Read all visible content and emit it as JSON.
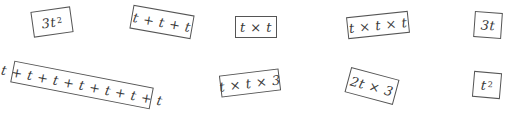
{
  "cards": [
    {
      "base": "3t",
      "sup": "2",
      "cx": 52,
      "cy": 22,
      "w": 40,
      "h": 26,
      "rot": -8
    },
    {
      "base": "t + t + t",
      "sup": "",
      "cx": 162,
      "cy": 22,
      "w": 62,
      "h": 24,
      "rot": 10
    },
    {
      "base": "t × t",
      "sup": "",
      "cx": 256,
      "cy": 27,
      "w": 42,
      "h": 22,
      "rot": 0
    },
    {
      "base": "t × t × t",
      "sup": "",
      "cx": 378,
      "cy": 25,
      "w": 62,
      "h": 22,
      "rot": -6
    },
    {
      "base": "3t",
      "sup": "",
      "cx": 488,
      "cy": 25,
      "w": 28,
      "h": 26,
      "rot": 4
    },
    {
      "base": "t + t + t + t + t + t + t",
      "sup": "",
      "cx": 82,
      "cy": 85,
      "w": 142,
      "h": 22,
      "rot": 11
    },
    {
      "base": "t × t × 3",
      "sup": "",
      "cx": 250,
      "cy": 83,
      "w": 60,
      "h": 22,
      "rot": -7
    },
    {
      "base": "2t × 3",
      "sup": "",
      "cx": 372,
      "cy": 86,
      "w": 50,
      "h": 26,
      "rot": 15
    },
    {
      "base": "t",
      "sup": "2",
      "cx": 487,
      "cy": 85,
      "w": 28,
      "h": 26,
      "rot": 5
    }
  ]
}
